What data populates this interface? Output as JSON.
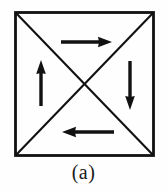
{
  "figure": {
    "caption": "(a)",
    "colors": {
      "stroke": "#111111",
      "background": "#fefefe",
      "caption": "#1a1a1a"
    },
    "square": {
      "name": "square-outline",
      "x": 15.5,
      "y": 12.5,
      "width": 138,
      "height": 143,
      "stroke_width": 2.8
    },
    "diagonals": [
      {
        "name": "diagonal-top-left-to-bottom-right",
        "x1": 16,
        "y1": 13,
        "x2": 153,
        "y2": 155,
        "stroke_width": 2.1
      },
      {
        "name": "diagonal-bottom-left-to-top-right",
        "x1": 16,
        "y1": 155,
        "x2": 153,
        "y2": 13,
        "stroke_width": 2.1
      }
    ],
    "center": {
      "x": 84.5,
      "y": 84
    },
    "arrows": [
      {
        "name": "arrow-top-right",
        "direction": "right",
        "label": "top arrow pointing right",
        "tail_x": 61,
        "tail_y": 42,
        "head_x": 112,
        "head_y": 42,
        "shaft_width": 3.4,
        "head_length": 13,
        "head_half_width": 5.2
      },
      {
        "name": "arrow-left-up",
        "direction": "up",
        "label": "left arrow pointing up",
        "tail_x": 41,
        "tail_y": 106,
        "head_x": 41,
        "head_y": 60,
        "shaft_width": 3.4,
        "head_length": 13,
        "head_half_width": 5.2
      },
      {
        "name": "arrow-right-down",
        "direction": "down",
        "label": "right arrow pointing down",
        "tail_x": 130,
        "tail_y": 61,
        "head_x": 130,
        "head_y": 110,
        "shaft_width": 3.4,
        "head_length": 13,
        "head_half_width": 5.2
      },
      {
        "name": "arrow-bottom-left",
        "direction": "left",
        "label": "bottom arrow pointing left",
        "tail_x": 114,
        "tail_y": 132,
        "head_x": 62,
        "head_y": 132,
        "shaft_width": 3.4,
        "head_length": 13,
        "head_half_width": 5.2
      }
    ]
  }
}
